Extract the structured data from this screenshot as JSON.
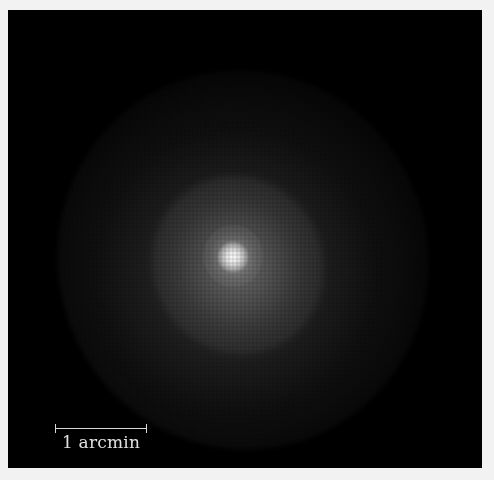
{
  "image": {
    "subject": "diffuse elliptical glow with bright central core on black background",
    "background_color": "#000000",
    "border_color": "#f2f2f2"
  },
  "scale_bar": {
    "label": "1 arcmin",
    "color": "#d8d8d8"
  }
}
